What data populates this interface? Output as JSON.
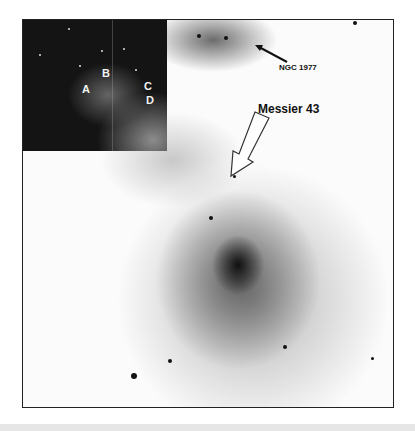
{
  "image": {
    "subject": "negative image of nebula field with inset",
    "inset_labels": [
      "A",
      "B",
      "C",
      "D"
    ],
    "annotations": {
      "ngc": "NGC 1977",
      "messier": "Messier 43"
    }
  }
}
